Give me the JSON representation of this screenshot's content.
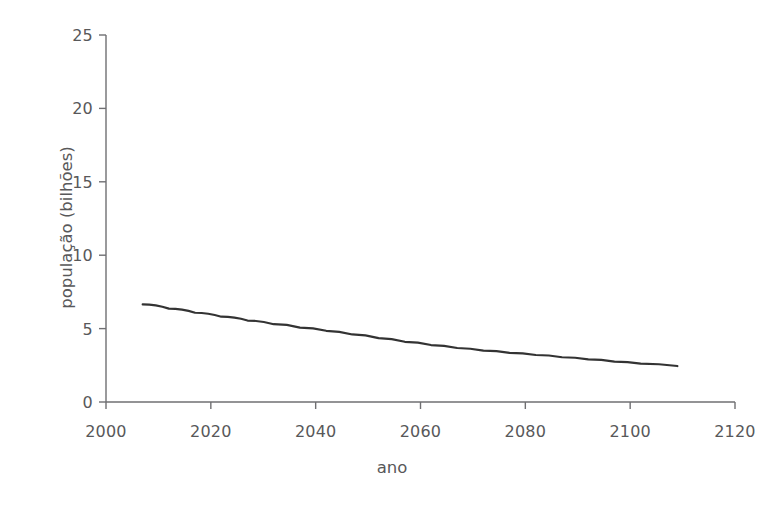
{
  "chart_data": {
    "type": "line",
    "title": "",
    "xlabel": "ano",
    "ylabel": "população (bilhões)",
    "xlim": [
      2000,
      2120
    ],
    "ylim": [
      0,
      25
    ],
    "grid": false,
    "legend": null,
    "xticks": [
      2000,
      2020,
      2040,
      2060,
      2080,
      2100,
      2120
    ],
    "xtick_labels": [
      "2000",
      "2020",
      "2040",
      "2060",
      "2080",
      "2100",
      "2120"
    ],
    "yticks": [
      0,
      5,
      10,
      15,
      20,
      25
    ],
    "ytick_labels": [
      "0",
      "5",
      "10",
      "15",
      "20",
      "25"
    ],
    "series": [
      {
        "name": "população",
        "color": "#333333",
        "linewidth": 2.2,
        "x": [
          2007,
          2012,
          2017,
          2022,
          2027,
          2032,
          2037,
          2042,
          2047,
          2052,
          2057,
          2062,
          2067,
          2072,
          2077,
          2082,
          2087,
          2092,
          2097,
          2102,
          2109
        ],
        "y": [
          6.65,
          6.36,
          6.08,
          5.81,
          5.55,
          5.3,
          5.07,
          4.85,
          4.6,
          4.35,
          4.1,
          3.88,
          3.68,
          3.5,
          3.35,
          3.2,
          3.05,
          2.9,
          2.75,
          2.62,
          2.45
        ]
      }
    ]
  },
  "axes": {
    "y_axis_title": "população (bilhões)",
    "x_axis_title": "ano"
  }
}
